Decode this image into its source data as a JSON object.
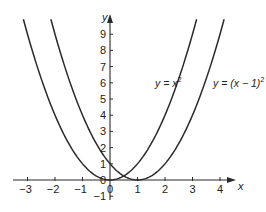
{
  "chart_data": {
    "type": "line",
    "title": "",
    "xlabel": "x",
    "ylabel": "y",
    "xlim": [
      -3.5,
      4.5
    ],
    "ylim": [
      -1,
      9.5
    ],
    "grid": false,
    "x_ticks": [
      -3,
      -2,
      -1,
      0,
      1,
      2,
      3,
      4
    ],
    "x_tick_labels": [
      "−3",
      "−2",
      "−1",
      "0",
      "1",
      "2",
      "3",
      "4"
    ],
    "y_ticks": [
      -1,
      0,
      1,
      2,
      3,
      4,
      5,
      6,
      7,
      8,
      9
    ],
    "y_tick_labels": [
      "−1",
      "0",
      "1",
      "2",
      "3",
      "4",
      "5",
      "6",
      "7",
      "8",
      "9"
    ],
    "series": [
      {
        "name": "y = x²",
        "label_main": "y = x",
        "label_sup": "2",
        "function": "x^2",
        "x_range": [
          -3.15,
          3.15
        ],
        "points": [
          [
            -3,
            9
          ],
          [
            -2,
            4
          ],
          [
            -1,
            1
          ],
          [
            0,
            0
          ],
          [
            1,
            1
          ],
          [
            2,
            4
          ],
          [
            3,
            9
          ]
        ]
      },
      {
        "name": "y = (x − 1)²",
        "label_main": "y = (x − 1)",
        "label_sup": "2",
        "function": "(x-1)^2",
        "x_range": [
          -2.15,
          4.15
        ],
        "points": [
          [
            -2,
            9
          ],
          [
            -1,
            4
          ],
          [
            0,
            1
          ],
          [
            1,
            0
          ],
          [
            2,
            1
          ],
          [
            3,
            4
          ],
          [
            4,
            9
          ]
        ]
      }
    ],
    "annotations": [
      {
        "text": "y = x²",
        "near": [
          1.7,
          5.8
        ]
      },
      {
        "text": "y = (x − 1)²",
        "near": [
          3.8,
          5.8
        ]
      }
    ]
  }
}
